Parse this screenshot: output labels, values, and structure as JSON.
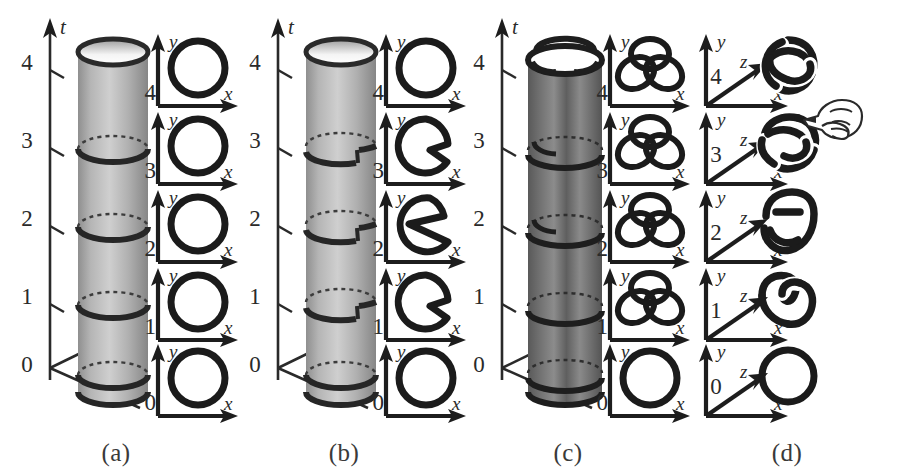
{
  "figure": {
    "background": "#ffffff",
    "ink": "#1b1b1b",
    "width": 898,
    "height": 475
  },
  "panels": [
    {
      "id": "a",
      "label": "(a)",
      "time_axis": {
        "name": "t",
        "ticks": [
          "4",
          "3",
          "2",
          "1",
          "0"
        ]
      },
      "tube": {
        "kind": "smooth-cylinder",
        "shading": "grey-gradient",
        "band_count": 5,
        "description": "unknotted solid cylinder world-tube"
      },
      "slices": [
        {
          "time": "4",
          "axes": [
            "y",
            "x"
          ],
          "shape": "circle"
        },
        {
          "time": "3",
          "axes": [
            "y",
            "x"
          ],
          "shape": "circle"
        },
        {
          "time": "2",
          "axes": [
            "y",
            "x"
          ],
          "shape": "circle"
        },
        {
          "time": "1",
          "axes": [
            "y",
            "x"
          ],
          "shape": "circle"
        },
        {
          "time": "0",
          "axes": [
            "y",
            "x"
          ],
          "shape": "circle"
        }
      ]
    },
    {
      "id": "b",
      "label": "(b)",
      "time_axis": {
        "name": "t",
        "ticks": [
          "4",
          "3",
          "2",
          "1",
          "0"
        ]
      },
      "tube": {
        "kind": "sliced-cylinder",
        "shading": "grey-gradient",
        "band_count": 5,
        "description": "cylinder with helical cut offsets between levels"
      },
      "slices": [
        {
          "time": "4",
          "axes": [
            "y",
            "x"
          ],
          "shape": "circle"
        },
        {
          "time": "3",
          "axes": [
            "y",
            "x"
          ],
          "shape": "notched-disc-shallow"
        },
        {
          "time": "2",
          "axes": [
            "y",
            "x"
          ],
          "shape": "spiral-cut-disc"
        },
        {
          "time": "1",
          "axes": [
            "y",
            "x"
          ],
          "shape": "notched-disc-shallow"
        },
        {
          "time": "0",
          "axes": [
            "y",
            "x"
          ],
          "shape": "circle"
        }
      ]
    },
    {
      "id": "c",
      "label": "(c)",
      "time_axis": {
        "name": "t",
        "ticks": [
          "4",
          "3",
          "2",
          "1",
          "0"
        ]
      },
      "tube": {
        "kind": "knotted-cylinder",
        "shading": "dark-grey-gradient",
        "band_count": 5,
        "description": "dark braided world-tube with knotted top rim"
      },
      "slices": [
        {
          "time": "4",
          "axes": [
            "y",
            "x"
          ],
          "shape": "trefoil"
        },
        {
          "time": "3",
          "axes": [
            "y",
            "x"
          ],
          "shape": "trefoil"
        },
        {
          "time": "2",
          "axes": [
            "y",
            "x"
          ],
          "shape": "trefoil"
        },
        {
          "time": "1",
          "axes": [
            "y",
            "x"
          ],
          "shape": "trefoil"
        },
        {
          "time": "0",
          "axes": [
            "y",
            "x"
          ],
          "shape": "circle"
        }
      ]
    },
    {
      "id": "d",
      "label": "(d)",
      "time_axis": null,
      "tube": null,
      "slices": [
        {
          "time": "4",
          "axes": [
            "y",
            "z",
            "x"
          ],
          "shape": "trefoil-3d"
        },
        {
          "time": "3",
          "axes": [
            "y",
            "z",
            "x"
          ],
          "shape": "trefoil-3d-forming"
        },
        {
          "time": "2",
          "axes": [
            "y",
            "z",
            "x"
          ],
          "shape": "loop-two-crossings"
        },
        {
          "time": "1",
          "axes": [
            "y",
            "z",
            "x"
          ],
          "shape": "loop-one-crossing"
        },
        {
          "time": "0",
          "axes": [
            "y",
            "z",
            "x"
          ],
          "shape": "circle"
        }
      ],
      "cursor": {
        "icon": "pointing-hand-icon",
        "points_at_time": "3"
      }
    }
  ],
  "axis_glyphs": {
    "x": "x",
    "y": "y",
    "z": "z",
    "t": "t"
  }
}
